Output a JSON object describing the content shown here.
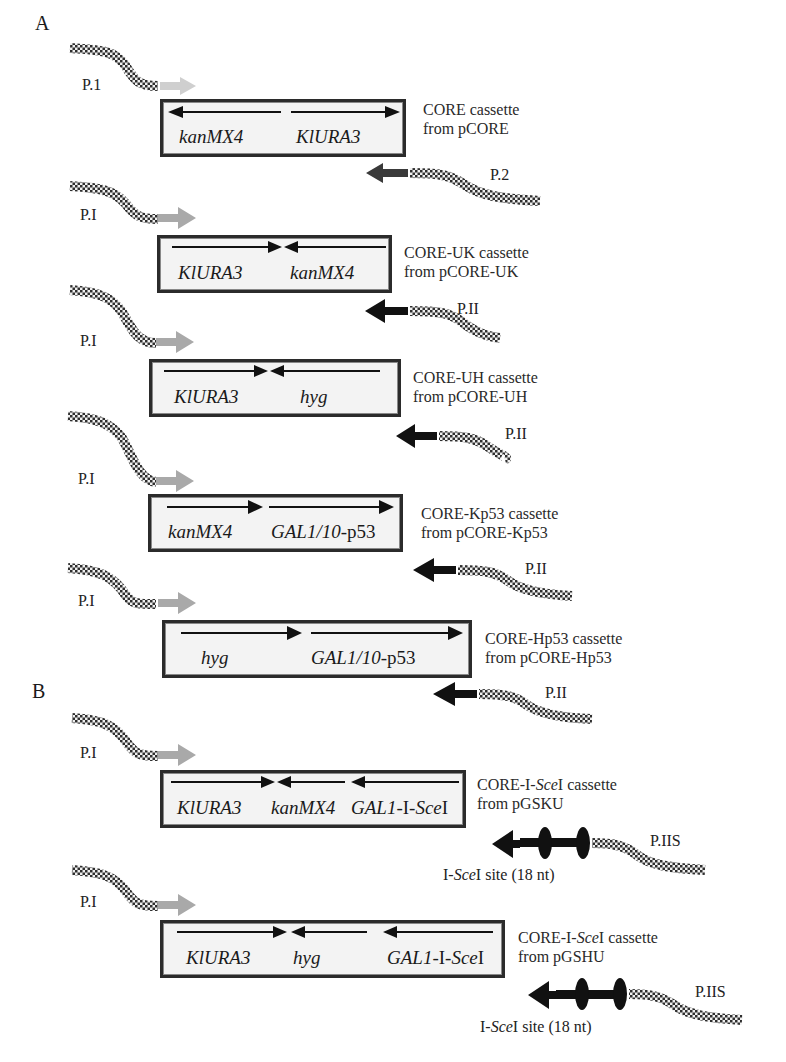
{
  "figure": {
    "panels": [
      {
        "label": "A",
        "x": 35,
        "y": 12
      },
      {
        "label": "B",
        "x": 32,
        "y": 680
      }
    ],
    "colors": {
      "forward_primer_arrow_light": "#cfcfcf",
      "forward_primer_arrow": "#a9a9a9",
      "reverse_primer_arrow": "#1a1a1a",
      "reverse_primer_arrow_first": "#3a3a3a",
      "box_border": "#2b2b2b",
      "box_fill": "#f3f3f3",
      "primer_tail": "#3a3a3a"
    },
    "constructs": [
      {
        "name": "CORE",
        "caption_line1": "CORE cassette",
        "caption_line2": "from pCORE",
        "fwd_primer": "P.1",
        "rev_primer": "P.2",
        "box": {
          "x": 160,
          "y": 99,
          "w": 246,
          "h": 58
        },
        "genes": [
          {
            "text": "kanMX4",
            "x": 176,
            "dir": "left",
            "ax1": 168,
            "ax2": 278
          },
          {
            "text": "KlURA3",
            "x": 293,
            "dir": "right",
            "ax1": 288,
            "ax2": 397
          }
        ]
      },
      {
        "name": "CORE-UK",
        "caption_line1": "CORE-UK cassette",
        "caption_line2": "from pCORE-UK",
        "fwd_primer": "P.I",
        "rev_primer": "P.II",
        "box": {
          "x": 157,
          "y": 235,
          "w": 235,
          "h": 58
        },
        "genes": [
          {
            "text": "KlURA3",
            "x": 175,
            "dir": "right",
            "ax1": 170,
            "ax2": 274
          },
          {
            "text": "kanMX4",
            "x": 288,
            "dir": "left",
            "ax1": 278,
            "ax2": 378
          }
        ]
      },
      {
        "name": "CORE-UH",
        "caption_line1": "CORE-UH cassette",
        "caption_line2": "from pCORE-UH",
        "fwd_primer": "P.I",
        "rev_primer": "P.II",
        "box": {
          "x": 149,
          "y": 359,
          "w": 252,
          "h": 58
        },
        "genes": [
          {
            "text": "KlURA3",
            "x": 172,
            "dir": "right",
            "ax1": 163,
            "ax2": 262
          },
          {
            "text": "hyg",
            "x": 298,
            "dir": "left",
            "ax1": 266,
            "ax2": 380
          }
        ]
      },
      {
        "name": "CORE-Kp53",
        "caption_line1": "CORE-Kp53 cassette",
        "caption_line2": "from pCORE-Kp53",
        "fwd_primer": "P.I",
        "rev_primer": "P.II",
        "box": {
          "x": 148,
          "y": 494,
          "w": 255,
          "h": 58
        },
        "genes": [
          {
            "text": "kanMX4",
            "x": 165,
            "dir": "right",
            "ax1": 165,
            "ax2": 258
          },
          {
            "text": "GAL1/10",
            "suffix": "-p53",
            "x": 268,
            "dir": "right",
            "ax1": 266,
            "ax2": 392
          }
        ]
      },
      {
        "name": "CORE-Hp53",
        "caption_line1": "CORE-Hp53 cassette",
        "caption_line2": "from pCORE-Hp53",
        "fwd_primer": "P.I",
        "rev_primer": "P.II",
        "box": {
          "x": 162,
          "y": 620,
          "w": 310,
          "h": 58
        },
        "genes": [
          {
            "text": "hyg",
            "x": 198,
            "dir": "right",
            "ax1": 178,
            "ax2": 300
          },
          {
            "text": "GAL1/10",
            "suffix": "-p53",
            "x": 310,
            "dir": "right",
            "ax1": 308,
            "ax2": 466
          }
        ]
      },
      {
        "name": "CORE-I-SceI-GSKU",
        "caption_line1_pre": "CORE-I-",
        "caption_line1_it": "Sce",
        "caption_line1_post": "I cassette",
        "caption_line2": "from pGSKU",
        "fwd_primer": "P.I",
        "rev_primer": "P.IIS",
        "site_pre": "I-",
        "site_it": "Sce",
        "site_post": "I site (18 nt)",
        "box": {
          "x": 160,
          "y": 770,
          "w": 306,
          "h": 58
        },
        "genes": [
          {
            "text": "KlURA3",
            "x": 175,
            "dir": "right",
            "ax1": 168,
            "ax2": 270
          },
          {
            "text": "kanMX4",
            "x": 283,
            "dir": "left",
            "ax1": 275,
            "ax2": 340
          },
          {
            "text": "GAL1",
            "suffix": "-I-",
            "suffix_it": "Sce",
            "suffix2": "I",
            "x": 349,
            "dir": "left",
            "ax1": 345,
            "ax2": 456
          }
        ]
      },
      {
        "name": "CORE-I-SceI-GSHU",
        "caption_line1_pre": "CORE-I-",
        "caption_line1_it": "Sce",
        "caption_line1_post": "I cassette",
        "caption_line2": "from pGSHU",
        "fwd_primer": "P.I",
        "rev_primer": "P.IIS",
        "site_pre": "I-",
        "site_it": "Sce",
        "site_post": "I site (18 nt)",
        "box": {
          "x": 160,
          "y": 920,
          "w": 345,
          "h": 58
        },
        "genes": [
          {
            "text": "KlURA3",
            "x": 185,
            "dir": "right",
            "ax1": 174,
            "ax2": 285
          },
          {
            "text": "hyg",
            "x": 290,
            "dir": "left",
            "ax1": 272,
            "ax2": 368
          },
          {
            "text": "GAL1",
            "suffix": "-I-",
            "suffix_it": "Sce",
            "suffix2": "I",
            "x": 385,
            "dir": "left",
            "ax1": 378,
            "ax2": 492
          }
        ]
      }
    ]
  }
}
